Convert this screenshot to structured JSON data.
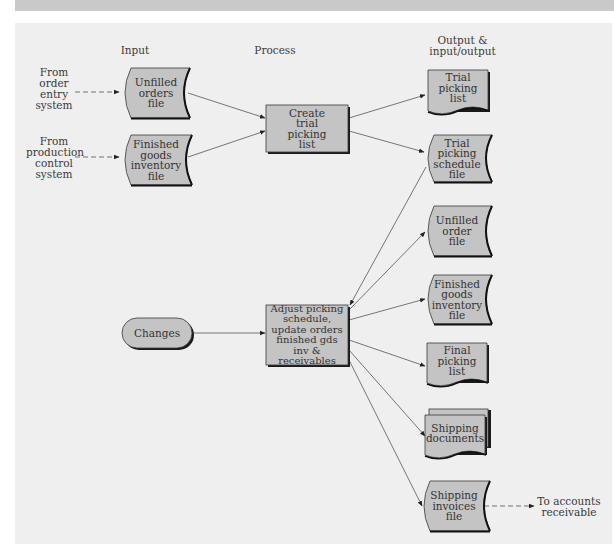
{
  "column_headers": {
    "input": "Input",
    "process": "Process",
    "output": "Output &\ninput/output"
  },
  "external_sources": {
    "order_entry": "From\norder\nentry\nsystem",
    "production_control": "From\nproduction\ncontrol\nsystem"
  },
  "inputs": {
    "unfilled_orders_file": "Unfilled\norders\nfile",
    "finished_goods_inventory_file": "Finished\ngoods\ninventory\nfile",
    "changes": "Changes"
  },
  "processes": {
    "create_trial_picking_list": "Create\ntrial\npicking\nlist",
    "adjust_picking_schedule": "Adjust picking\nschedule,\nupdate orders\nfinished gds\ninv & receivables"
  },
  "outputs": {
    "trial_picking_list": "Trial\npicking\nlist",
    "trial_picking_schedule_file": "Trial\npicking\nschedule\nfile",
    "unfilled_order_file": "Unfilled\norder\nfile",
    "finished_goods_inventory_file": "Finished\ngoods\ninventory file",
    "final_picking_list": "Final\npicking\nlist",
    "shipping_documents": "Shipping\ndocuments",
    "shipping_invoices_file": "Shipping\ninvoices\nfile"
  },
  "external_destinations": {
    "accounts_receivable": "To accounts\nreceivable"
  },
  "colors": {
    "panel_bg": "#efefef",
    "shape_fill": "#c4c4c4",
    "shape_stroke": "#3a3a3a",
    "shadow": "#1a1a1a",
    "line": "#555555"
  }
}
